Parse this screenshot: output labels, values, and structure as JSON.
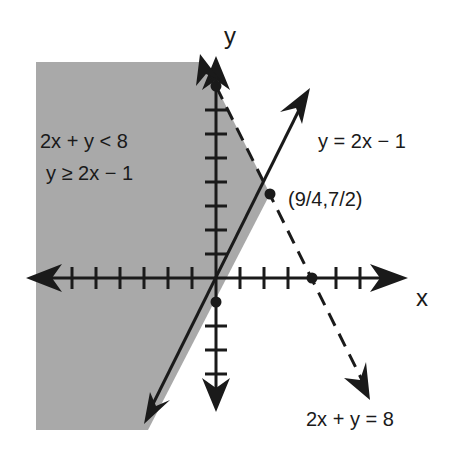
{
  "diagram": {
    "type": "system-of-linear-inequalities-graph",
    "axes": {
      "x_label": "x",
      "y_label": "y",
      "x_ticks": [
        -7,
        -6,
        -5,
        -4,
        -3,
        -2,
        -1,
        1,
        2,
        3,
        4,
        5,
        6,
        7
      ],
      "y_ticks": [
        -4,
        -3,
        -2,
        -1,
        1,
        2,
        3,
        4,
        5,
        6,
        7,
        8
      ],
      "unit_px": 24,
      "origin_px": [
        216,
        278
      ]
    },
    "region_label_line1": "2x + y < 8",
    "region_label_line2": "y ≥ 2x − 1",
    "line_solid_label": "y = 2x − 1",
    "line_dashed_label": "2x + y = 8",
    "intersection_label": "(9/4,7/2)",
    "points": [
      {
        "name": "y-intercept-dashed",
        "x": 0,
        "y": 8
      },
      {
        "name": "x-intercept-dashed",
        "x": 4,
        "y": 0
      },
      {
        "name": "y-intercept-solid",
        "x": 0,
        "y": -1
      },
      {
        "name": "intersection",
        "x": 2.25,
        "y": 3.5
      }
    ],
    "colors": {
      "shade": "#a9a9a9",
      "ink": "#1a1a1a",
      "background": "#ffffff"
    }
  }
}
